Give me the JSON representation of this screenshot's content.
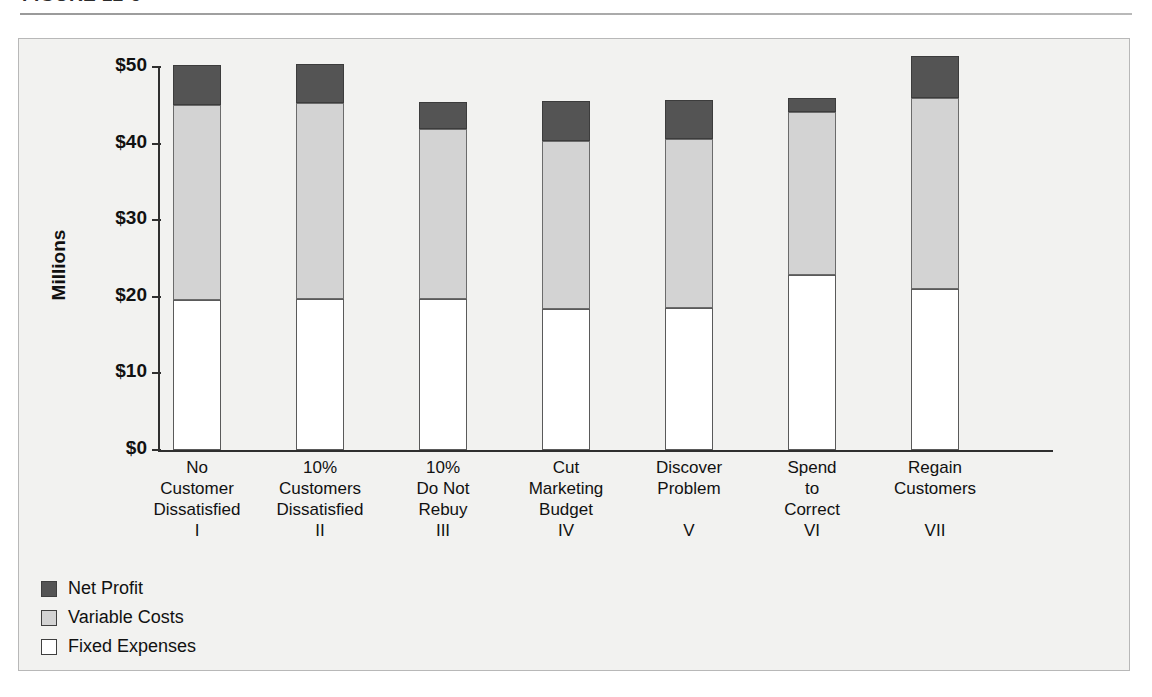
{
  "figure": {
    "title_partial": "FIGURE 12-5",
    "title_note": "cropped at top edge"
  },
  "chart_data": {
    "type": "bar",
    "subtype": "stacked-bar",
    "title": "",
    "xlabel": "",
    "ylabel": "Millions",
    "ylim": [
      0,
      50
    ],
    "y_ticks": [
      "$0",
      "$10",
      "$20",
      "$30",
      "$40",
      "$50"
    ],
    "y_tick_values": [
      0,
      10,
      20,
      30,
      40,
      50
    ],
    "grid": false,
    "legend_position": "below-left",
    "categories": [
      "No Customer Dissatisfied",
      "10% Customers Dissatisfied",
      "10% Do Not Rebuy",
      "Cut Marketing Budget",
      "Discover Problem",
      "Spend to Correct",
      "Regain Customers"
    ],
    "category_lines": [
      [
        "No",
        "Customer",
        "Dissatisfied"
      ],
      [
        "10%",
        "Customers",
        "Dissatisfied"
      ],
      [
        "10%",
        "Do Not",
        "Rebuy"
      ],
      [
        "Cut",
        "Marketing",
        "Budget"
      ],
      [
        "Discover",
        "Problem"
      ],
      [
        "Spend",
        "to",
        "Correct"
      ],
      [
        "Regain",
        "Customers"
      ]
    ],
    "category_romans": [
      "I",
      "II",
      "III",
      "IV",
      "V",
      "VI",
      "VII"
    ],
    "series": [
      {
        "name": "Fixed Expenses",
        "color": "#ffffff",
        "values": [
          19.6,
          19.7,
          19.7,
          18.4,
          18.6,
          22.8,
          21.0
        ]
      },
      {
        "name": "Variable Costs",
        "color": "#d3d3d3",
        "values": [
          25.4,
          25.6,
          22.2,
          21.9,
          22.0,
          21.3,
          25.0
        ]
      },
      {
        "name": "Net Profit",
        "color": "#545454",
        "values": [
          5.2,
          5.1,
          3.5,
          5.3,
          5.1,
          1.9,
          5.5
        ]
      }
    ],
    "totals": [
      50.2,
      50.4,
      45.4,
      45.6,
      45.7,
      46.0,
      51.5
    ]
  },
  "legend": {
    "items": [
      {
        "label": "Net Profit",
        "swatch": "#545454"
      },
      {
        "label": "Variable Costs",
        "swatch": "#d3d3d3"
      },
      {
        "label": "Fixed Expenses",
        "swatch": "#ffffff"
      }
    ]
  },
  "colors": {
    "net_profit": "#545454",
    "variable_costs": "#d3d3d3",
    "fixed_expenses": "#ffffff",
    "panel_background": "#f2f2f0",
    "axis": "#2f2f2f"
  }
}
